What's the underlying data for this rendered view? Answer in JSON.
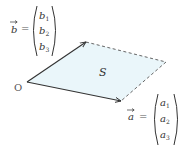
{
  "diagram": {
    "origin_label": "O",
    "area_label": "S",
    "colors": {
      "fill": "#EAF6FA",
      "stroke": "#333333",
      "dashed": "#555555"
    },
    "points": {
      "origin": [
        27,
        82
      ],
      "b_tip": [
        86,
        42
      ],
      "a_tip": [
        121,
        101
      ],
      "far_corner": [
        166,
        62
      ]
    },
    "vector_b": {
      "name": "b",
      "equals": "=",
      "components": [
        "b",
        "b",
        "b"
      ],
      "subscripts": [
        "1",
        "2",
        "3"
      ]
    },
    "vector_a": {
      "name": "a",
      "equals": "=",
      "components": [
        "a",
        "a",
        "a"
      ],
      "subscripts": [
        "1",
        "2",
        "3"
      ]
    }
  }
}
